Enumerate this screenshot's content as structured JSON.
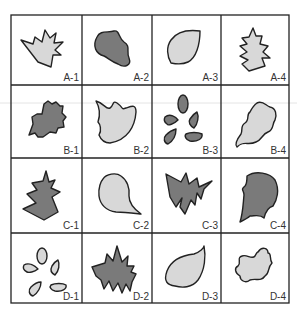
{
  "figure": {
    "colors": {
      "dark_fill": "#7a7a7a",
      "light_fill": "#d8d8d8",
      "stroke": "#222222",
      "grid": "#222222"
    },
    "rows": [
      "A",
      "B",
      "C",
      "D"
    ],
    "columns": [
      "1",
      "2",
      "3",
      "4"
    ],
    "cells": [
      {
        "label": "A-1",
        "shape": "maple-leaf",
        "fill": "light"
      },
      {
        "label": "A-2",
        "shape": "blob-leaf",
        "fill": "dark"
      },
      {
        "label": "A-3",
        "shape": "oval-leaf",
        "fill": "light"
      },
      {
        "label": "A-4",
        "shape": "serrated-leaf",
        "fill": "light"
      },
      {
        "label": "B-1",
        "shape": "spiky-round-leaf",
        "fill": "dark"
      },
      {
        "label": "B-2",
        "shape": "bitten-leaf",
        "fill": "light"
      },
      {
        "label": "B-3",
        "shape": "compound-leaflets",
        "fill": "dark"
      },
      {
        "label": "B-4",
        "shape": "wavy-leaf",
        "fill": "light"
      },
      {
        "label": "C-1",
        "shape": "fir-leaf",
        "fill": "dark"
      },
      {
        "label": "C-2",
        "shape": "teardrop-leaf",
        "fill": "light"
      },
      {
        "label": "C-3",
        "shape": "jagged-leaf",
        "fill": "dark"
      },
      {
        "label": "C-4",
        "shape": "notched-leaf",
        "fill": "dark"
      },
      {
        "label": "D-1",
        "shape": "compound-leaflets",
        "fill": "light"
      },
      {
        "label": "D-2",
        "shape": "spiky-wide-leaf",
        "fill": "dark"
      },
      {
        "label": "D-3",
        "shape": "pointed-leaf",
        "fill": "light"
      },
      {
        "label": "D-4",
        "shape": "lobed-leaf",
        "fill": "light"
      }
    ]
  }
}
